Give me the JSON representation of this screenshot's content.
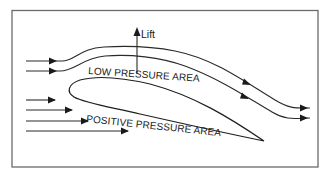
{
  "diagram": {
    "labels": {
      "lift": "Lift",
      "low_pressure": "LOW PRESSURE AREA",
      "positive_pressure": "POSITIVE PRESSURE AREA"
    },
    "elements": {
      "upper_flow_lines": 2,
      "lower_flow_lines": 4,
      "lift_arrow": "up-arrow",
      "airfoil": "wing cross-section"
    },
    "colors": {
      "stroke": "#1e1e1e",
      "frame": "#6b6b6b",
      "background": "#ffffff"
    }
  }
}
